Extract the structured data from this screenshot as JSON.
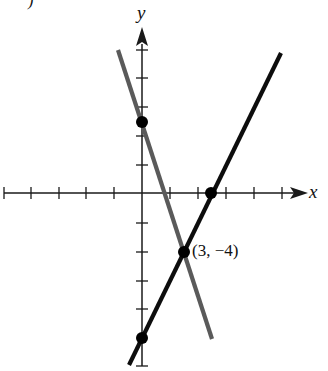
{
  "figure": {
    "part_label": ")",
    "x_axis_label": "x",
    "y_axis_label": "y",
    "intersection_label": "(3, −4)",
    "colors": {
      "axes": "#1a1a1a",
      "line_1": "#0d0d0d",
      "line_2": "#5a5a5a",
      "points": "#000000"
    },
    "lines": [
      {
        "name": "y = 2x − 10",
        "slope": 2,
        "intercept": -10,
        "color": "black"
      },
      {
        "name": "y = −3x + 5",
        "slope": -3,
        "intercept": 5,
        "color": "gray"
      }
    ],
    "points": [
      {
        "x": 0,
        "y": 5
      },
      {
        "x": 5,
        "y": 0
      },
      {
        "x": 3,
        "y": -4,
        "label": "(3, −4)"
      },
      {
        "x": 0,
        "y": -10
      }
    ],
    "tick_spacing": 2,
    "x_range": [
      -10,
      12
    ],
    "y_range": [
      -12,
      10
    ]
  }
}
